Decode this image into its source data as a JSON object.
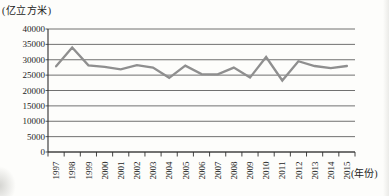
{
  "chart_data": {
    "type": "line",
    "title": "",
    "xlabel": "(年份)",
    "ylabel": "(亿立方米)",
    "categories": [
      "1997",
      "1998",
      "1999",
      "2000",
      "2001",
      "2002",
      "2003",
      "2004",
      "2005",
      "2006",
      "2007",
      "2008",
      "2009",
      "2010",
      "2011",
      "2012",
      "2013",
      "2014",
      "2015"
    ],
    "values": [
      27855,
      34017,
      28196,
      27701,
      26868,
      28261,
      27460,
      24130,
      28053,
      25330,
      25255,
      27434,
      24180,
      30906,
      23257,
      29529,
      27958,
      27267,
      27963
    ],
    "ylim": [
      0,
      40000
    ],
    "yticks": [
      0,
      5000,
      10000,
      15000,
      20000,
      25000,
      30000,
      35000,
      40000
    ],
    "grid": true,
    "legend": "none",
    "line_color": "#8f8f8f",
    "gridline_color": "#4d4d4d",
    "axis_color": "#2f2f2f",
    "text_color": "#1c1c1c"
  }
}
